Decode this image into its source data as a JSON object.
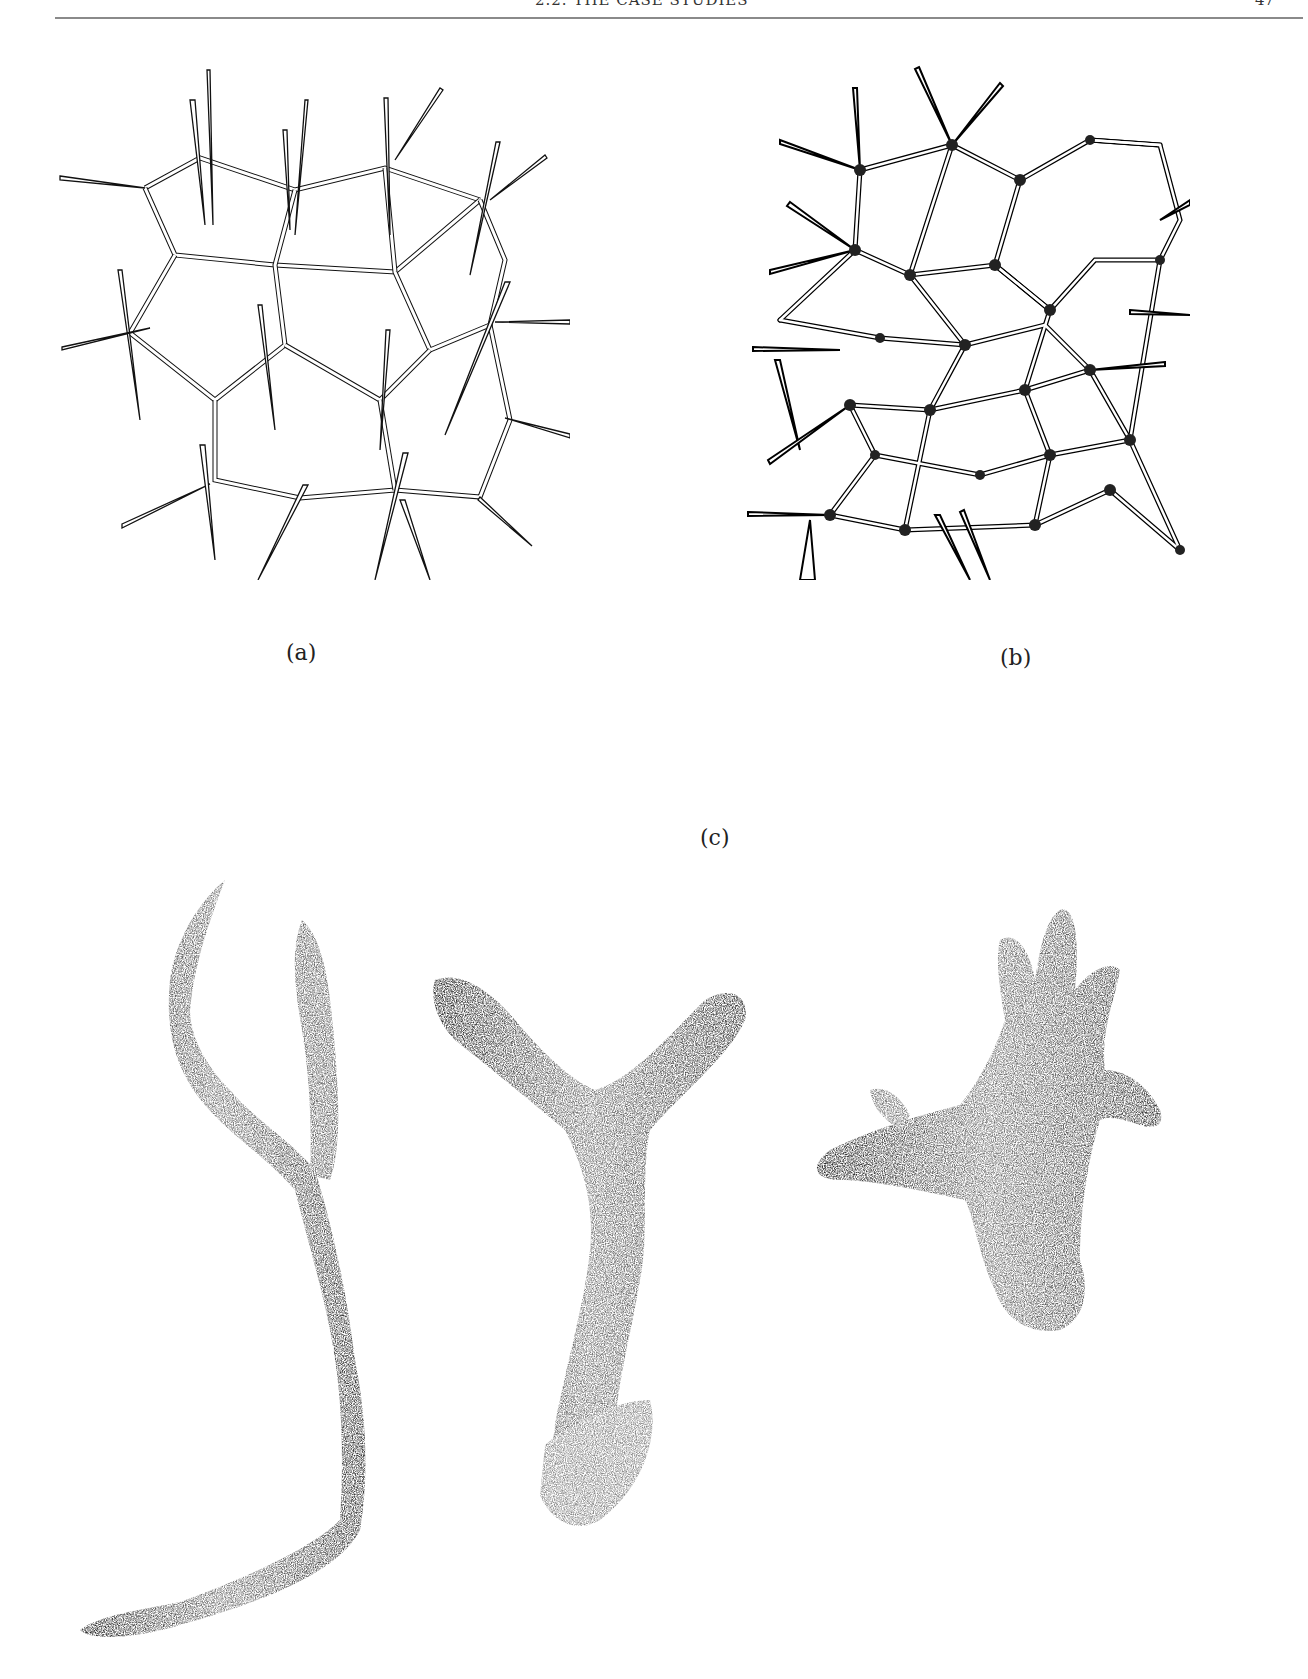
{
  "running_head": {
    "title": "2.2. THE CASE STUDIES",
    "page_number": "47"
  },
  "figure": {
    "panels": [
      {
        "id": "a",
        "label": "(a)",
        "description": "line drawing of a skeletal network of spicules with polygonal meshes"
      },
      {
        "id": "b",
        "label": "(b)",
        "description": "dense line drawing of tetractine/triradiate spicule network"
      },
      {
        "id": "c",
        "label": "(c)",
        "description": "three stippled drawings of branching sponge specimens"
      }
    ]
  },
  "colors": {
    "background": "#ffffff",
    "ink": "#111111",
    "rule": "#8a8a8a"
  }
}
